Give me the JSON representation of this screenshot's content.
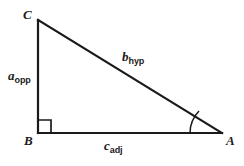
{
  "figure": {
    "type": "right-triangle-diagram",
    "background_color": "#ffffff",
    "stroke_color": "#1a1a1a",
    "vertices": {
      "c": {
        "label": "C",
        "x": 38,
        "y": 20
      },
      "b": {
        "label": "B",
        "x": 38,
        "y": 133
      },
      "a": {
        "label": "A",
        "x": 222,
        "y": 133
      }
    },
    "sides": {
      "opposite": {
        "base": "a",
        "subscript": "opp"
      },
      "hypotenuse": {
        "base": "b",
        "subscript": "hyp"
      },
      "adjacent": {
        "base": "c",
        "subscript": "adj"
      }
    },
    "markers": {
      "right_angle_at": "B",
      "angle_arc_at": "A"
    }
  }
}
